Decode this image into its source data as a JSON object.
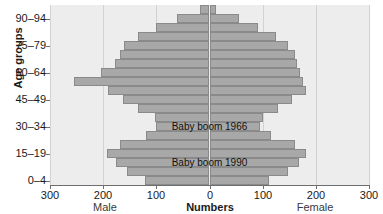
{
  "chart_data": {
    "type": "bar",
    "subtype": "population-pyramid",
    "title": "",
    "xlabel": "Numbers",
    "ylabel": "Age groups",
    "left_series_label": "Male",
    "right_series_label": "Female",
    "xlim": [
      -300,
      300
    ],
    "xticks": [
      -300,
      -200,
      -100,
      0,
      100,
      200,
      300
    ],
    "xticklabels": [
      "300",
      "200",
      "100",
      "0",
      "100",
      "200",
      "300"
    ],
    "grid": true,
    "legend": "none",
    "bar_color": "#a8a8a8",
    "bar_edge_color": "#8a8a8a",
    "plot_background": "#ededed",
    "categories": [
      "0–4",
      "5–9",
      "10–14",
      "15–19",
      "20–24",
      "25–29",
      "30–34",
      "35–39",
      "40–44",
      "45–49",
      "50–54",
      "55–59",
      "60–64",
      "65–69",
      "70–74",
      "75–79",
      "80–84",
      "85–89",
      "90–94",
      "95+"
    ],
    "yticklabels": [
      "0–4",
      "15–19",
      "30–34",
      "45–49",
      "60–64",
      "75–79",
      "90–94"
    ],
    "ytick_categories": [
      "0–4",
      "15–19",
      "30–34",
      "45–49",
      "60–64",
      "75–79",
      "90–94"
    ],
    "series": [
      {
        "name": "Male",
        "side": "left",
        "values": [
          122,
          155,
          175,
          192,
          168,
          120,
          100,
          103,
          135,
          162,
          190,
          255,
          205,
          178,
          168,
          160,
          135,
          100,
          62,
          18
        ]
      },
      {
        "name": "Female",
        "side": "right",
        "values": [
          112,
          148,
          168,
          182,
          160,
          115,
          95,
          100,
          128,
          155,
          182,
          175,
          170,
          165,
          160,
          148,
          125,
          92,
          55,
          12
        ]
      }
    ],
    "annotations": [
      {
        "text": "Baby boom 1966",
        "x": 0,
        "category": "30–34"
      },
      {
        "text": "Baby boom 1990",
        "x": 0,
        "category": "10–14"
      }
    ]
  }
}
